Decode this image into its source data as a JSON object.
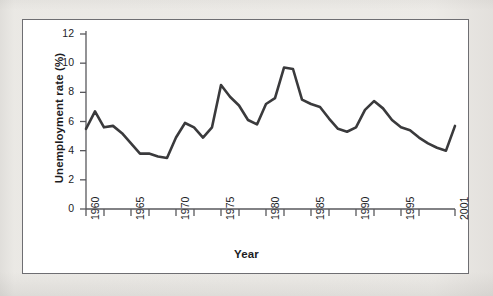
{
  "figure": {
    "frame_border_color": "#6e6e72",
    "page_background": "#f2f1ef",
    "plot_background": "#ffffff"
  },
  "chart_data": {
    "type": "line",
    "title": "",
    "subtitle": "",
    "xlabel": "Year",
    "ylabel": "Unemployment rate (%)",
    "xlim": [
      1960,
      2001
    ],
    "ylim": [
      0,
      12
    ],
    "grid": false,
    "legend": null,
    "legend_position": "none",
    "line_color": "#3a3a3c",
    "line_width": 2.6,
    "y_ticks": [
      0,
      2,
      4,
      6,
      8,
      10,
      12
    ],
    "y_tick_labels": [
      "0",
      "2",
      "4",
      "6",
      "8",
      "10",
      "12"
    ],
    "x_major_ticks": [
      1960,
      1965,
      1970,
      1975,
      1980,
      1985,
      1990,
      1995,
      2001
    ],
    "x_major_tick_labels": [
      "1960",
      "1965",
      "1970",
      "1975",
      "1980",
      "1985",
      "1990",
      "1995",
      "2001"
    ],
    "x_minor_ticks": [
      1962,
      1967,
      1972,
      1977,
      1982,
      1987,
      1992,
      1997
    ],
    "x": [
      1960,
      1961,
      1962,
      1963,
      1964,
      1965,
      1966,
      1967,
      1968,
      1969,
      1970,
      1971,
      1972,
      1973,
      1974,
      1975,
      1976,
      1977,
      1978,
      1979,
      1980,
      1981,
      1982,
      1983,
      1984,
      1985,
      1986,
      1987,
      1988,
      1989,
      1990,
      1991,
      1992,
      1993,
      1994,
      1995,
      1996,
      1997,
      1998,
      1999,
      2000,
      2001
    ],
    "values": [
      5.5,
      6.7,
      5.6,
      5.7,
      5.2,
      4.5,
      3.8,
      3.8,
      3.6,
      3.5,
      4.9,
      5.9,
      5.6,
      4.9,
      5.6,
      8.5,
      7.7,
      7.1,
      6.1,
      5.8,
      7.2,
      7.6,
      9.7,
      9.6,
      7.5,
      7.2,
      7.0,
      6.2,
      5.5,
      5.3,
      5.6,
      6.8,
      7.4,
      6.9,
      6.1,
      5.6,
      5.4,
      4.9,
      4.5,
      4.2,
      4.0,
      5.7
    ],
    "series_name": "Unemployment rate",
    "data_unit": "%"
  }
}
